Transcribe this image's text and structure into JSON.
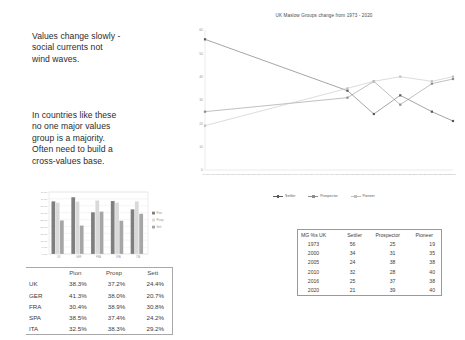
{
  "slide": {
    "quotes": [
      "Values change slowly -\nsocial currents not\nwind waves.",
      "In countries like these\nno one major values\ngroup is a majority.\nOften need to build a\ncross-values base."
    ]
  },
  "line_chart": {
    "title": "UK Maslow Groups change from 1973 - 2020",
    "legend": [
      "Settler",
      "Prospector",
      "Pioneer"
    ]
  },
  "mg_table": {
    "headers": [
      "MG %s UK",
      "Settler",
      "Prospector",
      "Pioneer"
    ],
    "rows": [
      [
        "1973",
        "56",
        "25",
        "19"
      ],
      [
        "2000",
        "34",
        "31",
        "35"
      ],
      [
        "2005",
        "24",
        "38",
        "38"
      ],
      [
        "2010",
        "32",
        "28",
        "40"
      ],
      [
        "2016",
        "25",
        "37",
        "38"
      ],
      [
        "2020",
        "21",
        "39",
        "40"
      ]
    ]
  },
  "country_table": {
    "headers": [
      "",
      "Pion",
      "Prosp",
      "Sett"
    ],
    "rows": [
      [
        "UK",
        "38.3%",
        "37.2%",
        "24.4%"
      ],
      [
        "GER",
        "41.3%",
        "38.0%",
        "20.7%"
      ],
      [
        "FRA",
        "30.4%",
        "38.9%",
        "30.8%"
      ],
      [
        "SPA",
        "38.5%",
        "37.4%",
        "24.2%"
      ],
      [
        "ITA",
        "32.5%",
        "38.3%",
        "29.2%"
      ]
    ]
  },
  "chart_data": [
    {
      "type": "line",
      "title": "UK Maslow Groups change from 1973 - 2020",
      "xlabel": "",
      "ylabel": "",
      "x": [
        1973,
        2000,
        2005,
        2010,
        2016,
        2020
      ],
      "xlim": [
        1973,
        2020
      ],
      "ylim": [
        0,
        60
      ],
      "yticks": [
        0,
        10,
        20,
        30,
        40,
        50,
        60
      ],
      "grid": false,
      "legend_position": "bottom",
      "series": [
        {
          "name": "Settler",
          "values": [
            56,
            34,
            24,
            32,
            25,
            21
          ],
          "color": "#595959"
        },
        {
          "name": "Prospector",
          "values": [
            25,
            31,
            38,
            28,
            37,
            39
          ],
          "color": "#8c8c8c"
        },
        {
          "name": "Pioneer",
          "values": [
            19,
            35,
            38,
            40,
            38,
            40
          ],
          "color": "#bfbfbf"
        }
      ]
    },
    {
      "type": "bar",
      "title": "",
      "xlabel": "",
      "ylabel": "",
      "categories": [
        "UK",
        "GER",
        "FRA",
        "SPA",
        "ITA"
      ],
      "ylim": [
        0,
        45
      ],
      "yticks": [
        "0.0%",
        "5.0%",
        "10.0%",
        "15.0%",
        "20.0%",
        "25.0%",
        "30.0%",
        "35.0%",
        "40.0%",
        "45.0%"
      ],
      "grid": true,
      "legend_position": "right",
      "series": [
        {
          "name": "Pion",
          "values": [
            38.3,
            41.3,
            30.4,
            38.5,
            32.5
          ],
          "color": "#7f7f7f"
        },
        {
          "name": "Prosp",
          "values": [
            37.2,
            38.0,
            38.9,
            37.4,
            38.3
          ],
          "color": "#d9d9d9"
        },
        {
          "name": "Sett",
          "values": [
            24.4,
            20.7,
            30.8,
            24.2,
            29.2
          ],
          "color": "#a6a6a6"
        }
      ]
    }
  ]
}
